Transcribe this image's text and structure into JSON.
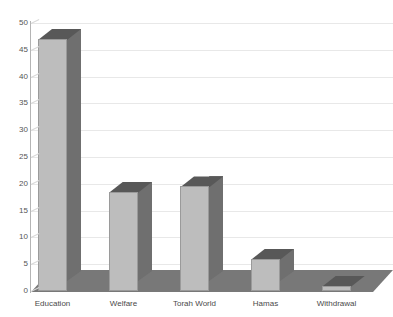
{
  "chart_data": {
    "type": "bar",
    "title": "",
    "xlabel": "",
    "ylabel": "",
    "categories": [
      "Education",
      "Welfare",
      "Torah World",
      "Hamas",
      "Withdrawal"
    ],
    "values": [
      47,
      18.5,
      19.5,
      6,
      1
    ],
    "ylim": [
      0,
      50
    ],
    "yticks": [
      0,
      5,
      10,
      15,
      20,
      25,
      30,
      35,
      40,
      45,
      50
    ],
    "ytick_labels": [
      "0",
      "5",
      "10",
      "15",
      "20",
      "25",
      "30",
      "35",
      "40",
      "45",
      "50"
    ],
    "grid": true,
    "legend": false,
    "style": "3d-bar",
    "colors": {
      "bar_front": "#bdbdbd",
      "bar_side": "#6f6f6f",
      "bar_top": "#585858",
      "floor": "#787878",
      "gridline": "#e8e8e8",
      "axis": "#b4b4b4",
      "text": "#4a4a4a",
      "background": "#ffffff"
    }
  },
  "axis": {
    "y": {
      "labels": [
        "50",
        "45",
        "40",
        "35",
        "30",
        "25",
        "20",
        "15",
        "10",
        "5",
        "0"
      ]
    },
    "x": {
      "labels": [
        "Education",
        "Welfare",
        "Torah World",
        "Hamas",
        "Withdrawal"
      ]
    }
  }
}
